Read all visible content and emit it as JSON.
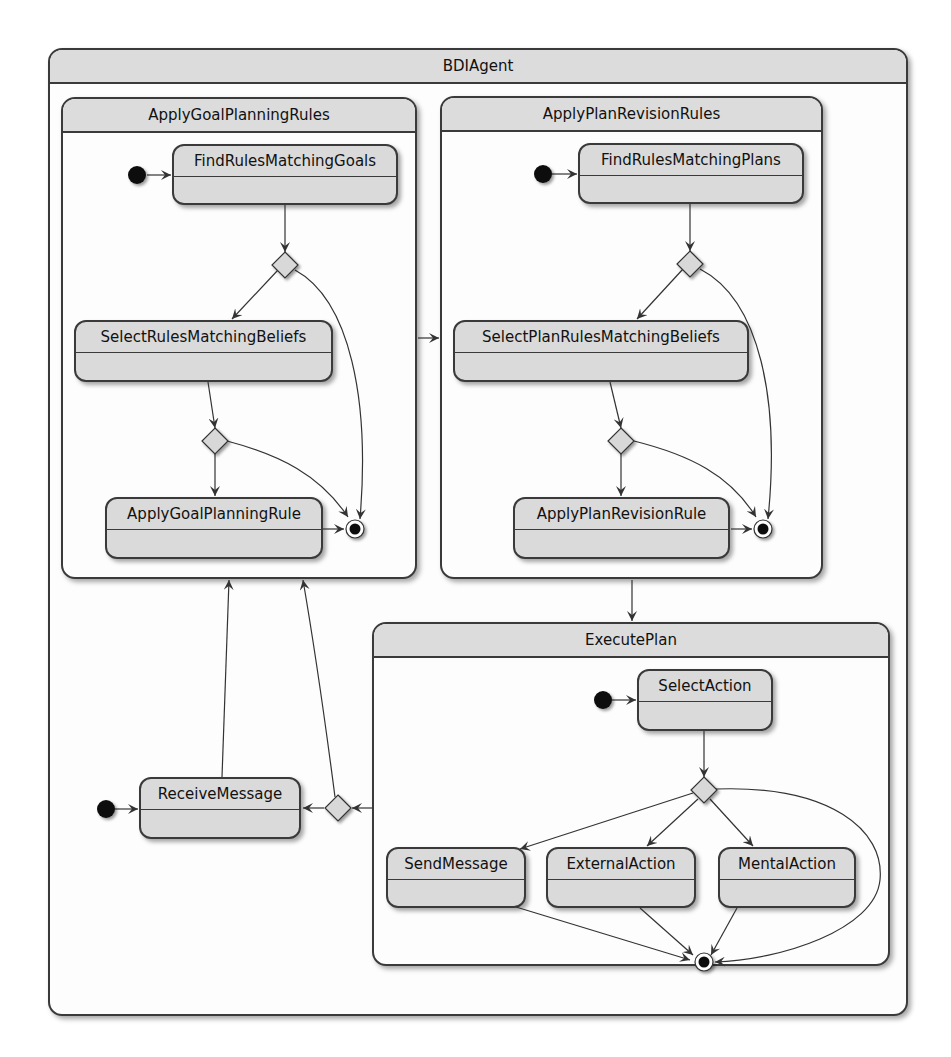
{
  "diagram": {
    "type": "state-machine",
    "root": {
      "title": "BDIAgent",
      "composites": {
        "goal": {
          "title": "ApplyGoalPlanningRules",
          "states": {
            "find": "FindRulesMatchingGoals",
            "select": "SelectRulesMatchingBeliefs",
            "apply": "ApplyGoalPlanningRule"
          }
        },
        "plan": {
          "title": "ApplyPlanRevisionRules",
          "states": {
            "find": "FindRulesMatchingPlans",
            "select": "SelectPlanRulesMatchingBeliefs",
            "apply": "ApplyPlanRevisionRule"
          }
        },
        "exec": {
          "title": "ExecutePlan",
          "states": {
            "select": "SelectAction",
            "send": "SendMessage",
            "external": "ExternalAction",
            "mental": "MentalAction"
          }
        }
      },
      "states": {
        "receive": "ReceiveMessage"
      }
    },
    "transitions": [
      [
        "[*]",
        "FindRulesMatchingGoals"
      ],
      [
        "FindRulesMatchingGoals",
        "choice1"
      ],
      [
        "choice1",
        "SelectRulesMatchingBeliefs"
      ],
      [
        "choice1",
        "[*]"
      ],
      [
        "SelectRulesMatchingBeliefs",
        "choice2"
      ],
      [
        "choice2",
        "ApplyGoalPlanningRule"
      ],
      [
        "choice2",
        "[*]"
      ],
      [
        "ApplyGoalPlanningRule",
        "[*]"
      ],
      [
        "ApplyGoalPlanningRules",
        "ApplyPlanRevisionRules"
      ],
      [
        "[*]",
        "FindRulesMatchingPlans"
      ],
      [
        "FindRulesMatchingPlans",
        "choice3"
      ],
      [
        "choice3",
        "SelectPlanRulesMatchingBeliefs"
      ],
      [
        "choice3",
        "[*]"
      ],
      [
        "SelectPlanRulesMatchingBeliefs",
        "choice4"
      ],
      [
        "choice4",
        "ApplyPlanRevisionRule"
      ],
      [
        "choice4",
        "[*]"
      ],
      [
        "ApplyPlanRevisionRule",
        "[*]"
      ],
      [
        "ApplyPlanRevisionRules",
        "ExecutePlan"
      ],
      [
        "[*]",
        "SelectAction"
      ],
      [
        "SelectAction",
        "choice5"
      ],
      [
        "choice5",
        "SendMessage"
      ],
      [
        "choice5",
        "ExternalAction"
      ],
      [
        "choice5",
        "MentalAction"
      ],
      [
        "choice5",
        "[*]"
      ],
      [
        "SendMessage",
        "[*]"
      ],
      [
        "ExternalAction",
        "[*]"
      ],
      [
        "MentalAction",
        "[*]"
      ],
      [
        "ExecutePlan",
        "choice6"
      ],
      [
        "choice6",
        "ReceiveMessage"
      ],
      [
        "choice6",
        "ApplyGoalPlanningRules"
      ],
      [
        "[*]",
        "ReceiveMessage"
      ],
      [
        "ReceiveMessage",
        "ApplyGoalPlanningRules"
      ]
    ],
    "colors": {
      "state_fill": "#dadada",
      "header_fill": "#dcdcdc",
      "border": "#3a3a3a",
      "background": "#ffffff"
    }
  }
}
